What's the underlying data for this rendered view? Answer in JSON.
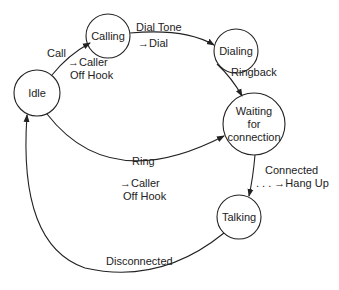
{
  "diagram": {
    "type": "state-machine",
    "nodes": [
      {
        "id": "idle",
        "label": "Idle"
      },
      {
        "id": "calling",
        "label": "Calling"
      },
      {
        "id": "dialing",
        "label": "Dialing"
      },
      {
        "id": "waiting",
        "label_lines": [
          "Waiting",
          "for",
          "connection"
        ]
      },
      {
        "id": "talking",
        "label": "Talking"
      }
    ],
    "edges": [
      {
        "from": "idle",
        "to": "calling",
        "event": "Call",
        "action_lines": [
          "→Caller",
          "Off Hook"
        ]
      },
      {
        "from": "calling",
        "to": "dialing",
        "event": "Dial Tone",
        "action": "→Dial"
      },
      {
        "from": "dialing",
        "to": "waiting",
        "event": "Ringback"
      },
      {
        "from": "idle",
        "to": "waiting",
        "event": "Ring",
        "action_lines": [
          "→Caller",
          "Off Hook"
        ]
      },
      {
        "from": "waiting",
        "to": "talking",
        "event": "Connected",
        "action": ". . . →Hang Up"
      },
      {
        "from": "talking",
        "to": "idle",
        "event": "Disconnected"
      }
    ]
  }
}
